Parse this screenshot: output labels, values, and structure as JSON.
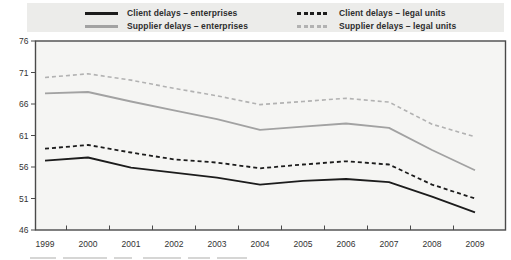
{
  "legend": {
    "items": [
      {
        "label": "Client delays – enterprises",
        "color": "#1c1c1c",
        "style": "solid"
      },
      {
        "label": "Supplier delays – enterprises",
        "color": "#a2a2a2",
        "style": "solid"
      },
      {
        "label": "Client delays – legal units",
        "color": "#1c1c1c",
        "style": "dashed"
      },
      {
        "label": "Supplier delays – legal units",
        "color": "#b2b2b2",
        "style": "dashed"
      }
    ]
  },
  "chart_data": {
    "type": "line",
    "title": "",
    "xlabel": "",
    "ylabel": "",
    "x": [
      "1999",
      "2000",
      "2001",
      "2002",
      "2003",
      "2004",
      "2005",
      "2006",
      "2007",
      "2008",
      "2009"
    ],
    "yticks": [
      46,
      51,
      56,
      61,
      66,
      71,
      76
    ],
    "ylim": [
      46,
      76
    ],
    "grid": false,
    "legend_position": "top",
    "series": [
      {
        "name": "Supplier delays – legal units",
        "style": "dashed",
        "color": "#b2b2b2",
        "width": 1.6,
        "values": [
          70.2,
          70.8,
          69.8,
          68.5,
          67.3,
          65.9,
          66.4,
          66.9,
          66.3,
          62.8,
          60.8
        ]
      },
      {
        "name": "Supplier delays – enterprises",
        "style": "solid",
        "color": "#a2a2a2",
        "width": 1.8,
        "values": [
          67.7,
          67.9,
          66.4,
          65.0,
          63.6,
          61.9,
          62.4,
          62.9,
          62.2,
          58.7,
          55.5
        ]
      },
      {
        "name": "Client delays – legal units",
        "style": "dashed",
        "color": "#1c1c1c",
        "width": 1.8,
        "values": [
          58.9,
          59.5,
          58.3,
          57.2,
          56.7,
          55.8,
          56.4,
          56.9,
          56.4,
          53.2,
          51.0
        ]
      },
      {
        "name": "Client delays – enterprises",
        "style": "solid",
        "color": "#1c1c1c",
        "width": 1.8,
        "values": [
          57.0,
          57.5,
          55.9,
          55.1,
          54.3,
          53.2,
          53.8,
          54.1,
          53.6,
          51.3,
          48.8
        ]
      }
    ],
    "plot_background": "#f5f5f3",
    "frame_color": "#4a4a4a"
  }
}
